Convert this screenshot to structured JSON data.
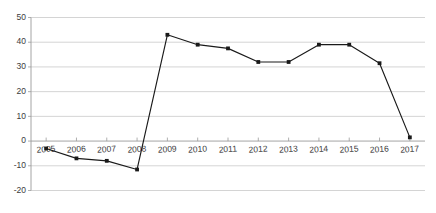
{
  "chart_data": {
    "type": "line",
    "title": "",
    "subtitle": "",
    "xlabel": "",
    "ylabel": "",
    "categories": [
      "2005",
      "2006",
      "2007",
      "2008",
      "2009",
      "2010",
      "2011",
      "2012",
      "2013",
      "2014",
      "2015",
      "2016",
      "2017"
    ],
    "values": [
      -3,
      -7,
      -8,
      -11.5,
      43,
      39,
      37.5,
      32,
      32,
      39,
      39,
      31.5,
      1.5
    ],
    "series": [
      {
        "name": "",
        "values": [
          -3,
          -7,
          -8,
          -11.5,
          43,
          39,
          37.5,
          32,
          32,
          39,
          39,
          31.5,
          1.5
        ]
      }
    ],
    "ylim": [
      -20,
      50
    ],
    "ytick_labels": [
      "50",
      "40",
      "30",
      "20",
      "10",
      "0",
      "-10",
      "-20"
    ],
    "ytick_values": [
      50,
      40,
      30,
      20,
      10,
      0,
      -10,
      -20
    ],
    "grid": true,
    "legend": false,
    "legend_position": "none",
    "markers": true,
    "line_color": "#1a1a1a",
    "marker_color": "#1a1a1a",
    "grid_color": "#c9c9c9",
    "axis_color": "#9a9a9a",
    "background_color": "#ffffff",
    "annotations": []
  }
}
